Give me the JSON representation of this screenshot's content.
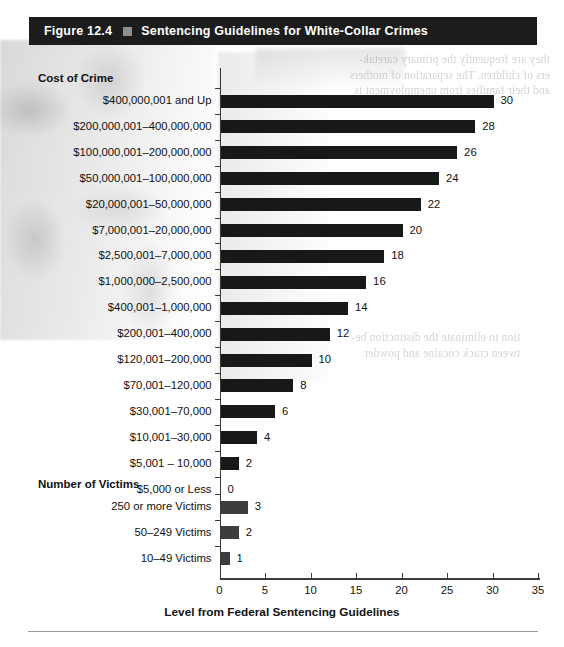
{
  "figure": {
    "number": "Figure 12.4",
    "marker_icon": "square-bullet-icon",
    "title": "Sentencing Guidelines for White-Collar Crimes"
  },
  "groups": {
    "cost_of_crime": "Cost of Crime",
    "number_of_victims": "Number of Victims"
  },
  "axis": {
    "x_title": "Level from Federal Sentencing Guidelines",
    "x_ticks": [
      "0",
      "5",
      "10",
      "15",
      "20",
      "25",
      "30",
      "35"
    ],
    "x_min": 0,
    "x_max": 35
  },
  "ghost_text": {
    "right_col": "they are frequently the primary caretak-\ners of children. The separation of mothers\nand their families from unemployment is",
    "left_col": "tion to eliminate the distinction be-\ntween crack cocaine and powder"
  },
  "chart_data": {
    "type": "bar",
    "orientation": "horizontal",
    "title": "Sentencing Guidelines for White-Collar Crimes",
    "xlabel": "Level from Federal Sentencing Guidelines",
    "ylabel": "",
    "xlim": [
      0,
      35
    ],
    "grid": false,
    "legend": false,
    "bar_color": "#181818",
    "secondary_bar_color": "#3d3d3d",
    "groups": [
      {
        "name": "Cost of Crime",
        "categories": [
          "$400,000,001 and Up",
          "$200,000,001–400,000,000",
          "$100,000,001–200,000,000",
          "$50,000,001–100,000,000",
          "$20,000,001–50,000,000",
          "$7,000,001–20,000,000",
          "$2,500,001–7,000,000",
          "$1,000,000–2,500,000",
          "$400,001–1,000,000",
          "$200,001–400,000",
          "$120,001–200,000",
          "$70,001–120,000",
          "$30,001–70,000",
          "$10,001–30,000",
          "$5,001 – 10,000",
          "$5,000 or Less"
        ],
        "values": [
          30,
          28,
          26,
          24,
          22,
          20,
          18,
          16,
          14,
          12,
          10,
          8,
          6,
          4,
          2,
          0
        ]
      },
      {
        "name": "Number of Victims",
        "categories": [
          "250 or more Victims",
          "50–249 Victims",
          "10–49 Victims"
        ],
        "values": [
          3,
          2,
          1
        ]
      }
    ]
  }
}
